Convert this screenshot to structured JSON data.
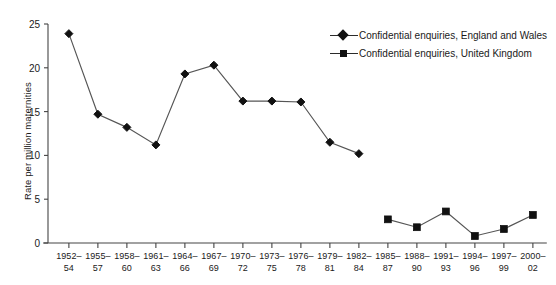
{
  "chart_data": {
    "type": "line",
    "title": "",
    "xlabel": "",
    "ylabel": "Rate per million maternities",
    "ylim": [
      0,
      25
    ],
    "yticks": [
      0,
      5,
      10,
      15,
      20,
      25
    ],
    "grid": false,
    "legend_position": "top-right",
    "categories": [
      "1952–\n54",
      "1955–\n57",
      "1958–\n60",
      "1961–\n63",
      "1964–\n66",
      "1967–\n69",
      "1970–\n72",
      "1973–\n75",
      "1976–\n78",
      "1979–\n81",
      "1982–\n84",
      "1985–\n87",
      "1988–\n90",
      "1991–\n93",
      "1994–\n96",
      "1997–\n99",
      "2000–\n02"
    ],
    "series": [
      {
        "name": "Confidential enquiries, England and Wales",
        "marker": "diamond",
        "color": "#111111",
        "values": [
          23.9,
          14.7,
          13.2,
          11.2,
          19.3,
          20.3,
          16.2,
          16.2,
          16.1,
          11.5,
          10.2,
          null,
          null,
          null,
          null,
          null,
          null
        ]
      },
      {
        "name": "Confidential enquiries, United Kingdom",
        "marker": "square",
        "color": "#111111",
        "values": [
          null,
          null,
          null,
          null,
          null,
          null,
          null,
          null,
          null,
          null,
          null,
          2.7,
          1.8,
          3.6,
          0.8,
          1.6,
          3.2
        ]
      }
    ]
  },
  "legend": {
    "items": [
      {
        "label": "Confidential enquiries, England and Wales",
        "marker": "diamond"
      },
      {
        "label": "Confidential enquiries, United Kingdom",
        "marker": "square"
      }
    ]
  },
  "axis": {
    "y_label": "Rate per million maternities",
    "y_ticks": [
      "0",
      "5",
      "10",
      "15",
      "20",
      "25"
    ]
  }
}
